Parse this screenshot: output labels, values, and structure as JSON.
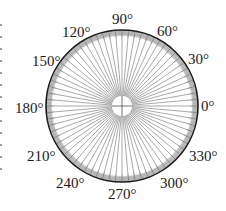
{
  "diagram": {
    "type": "protractor-circle",
    "center": [
      122,
      106
    ],
    "radius": 76,
    "inner_circle_radius": 10,
    "spoke_step_deg": 5,
    "rim_tick_step_deg": 1,
    "colors": {
      "outline": "#1a1a1a",
      "rim_band": "#a8a8a8",
      "spokes": "#6e6e6e",
      "labels": "#1a1a1a",
      "background": "#ffffff"
    },
    "labels": [
      {
        "angle": 0,
        "text": "0°"
      },
      {
        "angle": 30,
        "text": "30°"
      },
      {
        "angle": 60,
        "text": "60°"
      },
      {
        "angle": 90,
        "text": "90°"
      },
      {
        "angle": 120,
        "text": "120°"
      },
      {
        "angle": 150,
        "text": "150°"
      },
      {
        "angle": 180,
        "text": "180°"
      },
      {
        "angle": 210,
        "text": "210°"
      },
      {
        "angle": 240,
        "text": "240°"
      },
      {
        "angle": 270,
        "text": "270°"
      },
      {
        "angle": 300,
        "text": "300°"
      },
      {
        "angle": 330,
        "text": "330°"
      }
    ]
  }
}
